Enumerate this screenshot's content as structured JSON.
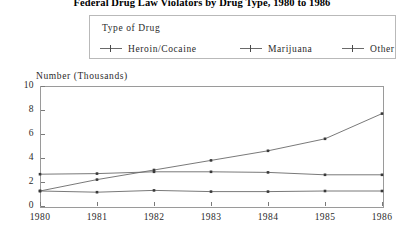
{
  "title": "Federal Drug Law Violators by Drug Type, 1980 to 1986",
  "legend": {
    "title": "Type of Drug",
    "entries": [
      {
        "label": "Heroin/Cocaine"
      },
      {
        "label": "Marijuana"
      },
      {
        "label": "Other"
      }
    ]
  },
  "axis": {
    "ylabel": "Number (Thousands)",
    "yticks": [
      "0",
      "2",
      "4",
      "6",
      "8",
      "10"
    ],
    "xticks": [
      "1980",
      "1981",
      "1982",
      "1983",
      "1984",
      "1985",
      "1986"
    ]
  },
  "colors": {
    "line": "#6a6a6a",
    "frame": "#9a9a9a",
    "text": "#2a2a2a",
    "marker": "#3a3a3a"
  },
  "chart_data": {
    "type": "line",
    "title": "Federal Drug Law Violators by Drug Type, 1980 to 1986",
    "xlabel": "",
    "ylabel": "Number (Thousands)",
    "x": [
      1980,
      1981,
      1982,
      1983,
      1984,
      1985,
      1986
    ],
    "xlim": [
      1980,
      1986
    ],
    "ylim": [
      0,
      10
    ],
    "yticks": [
      0,
      2,
      4,
      6,
      8,
      10
    ],
    "grid": false,
    "legend_position": "top-outside",
    "legend_title": "Type of Drug",
    "series": [
      {
        "name": "Heroin/Cocaine",
        "values": [
          1.25,
          2.2,
          3.0,
          3.8,
          4.6,
          5.6,
          7.7
        ]
      },
      {
        "name": "Marijuana",
        "values": [
          2.65,
          2.7,
          2.85,
          2.85,
          2.8,
          2.6,
          2.6
        ]
      },
      {
        "name": "Other",
        "values": [
          1.25,
          1.15,
          1.3,
          1.2,
          1.2,
          1.25,
          1.25
        ]
      }
    ]
  }
}
